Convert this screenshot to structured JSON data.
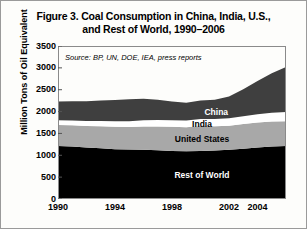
{
  "figure": {
    "title_line1": "Figure 3. Coal Consumption in China, India, U.S.,",
    "title_line2": "and Rest of World, 1990–2006",
    "source_note": "Source: BP, UN, DOE, IEA, press reports"
  },
  "chart_data": {
    "type": "area",
    "stacked": true,
    "title": "Figure 3. Coal Consumption in China, India, U.S., and Rest of World, 1990–2006",
    "xlabel": "",
    "ylabel": "Million Tons of Oil Equivalent",
    "xlim": [
      1990,
      2006
    ],
    "ylim": [
      0,
      3500
    ],
    "ytick_values": [
      0,
      500,
      1000,
      1500,
      2000,
      2500,
      3000,
      3500
    ],
    "ytick_labels": [
      "0",
      "500",
      "1000",
      "1500",
      "2000",
      "2500",
      "3000",
      "3500"
    ],
    "xtick_values": [
      1990,
      1994,
      1998,
      2002,
      2004
    ],
    "xtick_labels": [
      "1990",
      "1994",
      "1998",
      "2002",
      "2004"
    ],
    "grid": false,
    "legend": "inline-labels",
    "x": [
      1990,
      1991,
      1992,
      1993,
      1994,
      1995,
      1996,
      1997,
      1998,
      1999,
      2000,
      2001,
      2002,
      2003,
      2004,
      2005,
      2006
    ],
    "series": [
      {
        "name": "Rest of World",
        "color": "#000000",
        "label_color": "#ffffff",
        "values": [
          1215,
          1200,
          1180,
          1160,
          1140,
          1130,
          1125,
          1115,
          1100,
          1095,
          1100,
          1110,
          1125,
          1150,
          1180,
          1200,
          1215
        ]
      },
      {
        "name": "United States",
        "color": "#a8a8a8",
        "label_color": "#000000",
        "values": [
          480,
          485,
          490,
          505,
          510,
          515,
          535,
          545,
          550,
          545,
          570,
          555,
          550,
          565,
          570,
          575,
          565
        ]
      },
      {
        "name": "India",
        "color": "#ffffff",
        "label_color": "#000000",
        "values": [
          105,
          110,
          115,
          120,
          128,
          135,
          142,
          148,
          152,
          158,
          162,
          165,
          170,
          178,
          190,
          200,
          208
        ]
      },
      {
        "name": "China",
        "color": "#3f3f3f",
        "label_color": "#ffffff",
        "values": [
          430,
          440,
          450,
          470,
          485,
          500,
          490,
          460,
          430,
          405,
          420,
          440,
          500,
          620,
          760,
          900,
          1030
        ]
      }
    ],
    "totals": [
      2230,
      2235,
      2235,
      2255,
      2263,
      2280,
      2292,
      2268,
      2232,
      2203,
      2252,
      2270,
      2345,
      2513,
      2700,
      2875,
      3018
    ]
  }
}
